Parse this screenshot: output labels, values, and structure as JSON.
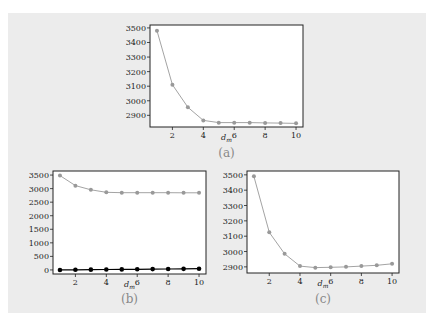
{
  "chart_data": [
    {
      "id": "a",
      "type": "line",
      "caption": "(a)",
      "xlabel": "d_m",
      "ylabel": "",
      "x": [
        1,
        2,
        3,
        4,
        5,
        6,
        7,
        8,
        9,
        10
      ],
      "xticks": [
        2,
        4,
        6,
        8,
        10
      ],
      "yticks": [
        2900,
        3000,
        3100,
        3200,
        3300,
        3400,
        3500
      ],
      "xlim": [
        0.55,
        10.45
      ],
      "ylim": [
        2820,
        3520
      ],
      "grid": false,
      "series": [
        {
          "name": "series-1",
          "color": "#999999",
          "marker": "circle",
          "values": [
            3480,
            3110,
            2955,
            2865,
            2850,
            2850,
            2850,
            2848,
            2847,
            2845
          ]
        }
      ],
      "box": {
        "left": 150,
        "top": 25,
        "right": 303,
        "bottom": 127
      },
      "xlabel_y": 140,
      "caption_y": 157
    },
    {
      "id": "b",
      "type": "line",
      "caption": "(b)",
      "xlabel": "d_m",
      "ylabel": "",
      "x": [
        1,
        2,
        3,
        4,
        5,
        6,
        7,
        8,
        9,
        10
      ],
      "xticks": [
        2,
        4,
        6,
        8,
        10
      ],
      "yticks": [
        0,
        500,
        1000,
        1500,
        2000,
        2500,
        3000,
        3500
      ],
      "xlim": [
        0.55,
        10.45
      ],
      "ylim": [
        -150,
        3650
      ],
      "grid": false,
      "series": [
        {
          "name": "series-1",
          "color": "#999999",
          "marker": "circle",
          "values": [
            3480,
            3110,
            2955,
            2865,
            2850,
            2850,
            2850,
            2848,
            2847,
            2845
          ]
        },
        {
          "name": "series-2",
          "color": "#000000",
          "marker": "circle",
          "values": [
            0,
            5,
            10,
            15,
            20,
            25,
            30,
            35,
            40,
            45
          ]
        }
      ],
      "box": {
        "left": 53,
        "top": 171,
        "right": 206,
        "bottom": 274
      },
      "xlabel_y": 287,
      "caption_y": 303
    },
    {
      "id": "c",
      "type": "line",
      "caption": "(c)",
      "xlabel": "d_m",
      "ylabel": "",
      "x": [
        1,
        2,
        3,
        4,
        5,
        6,
        7,
        8,
        9,
        10
      ],
      "xticks": [
        2,
        4,
        6,
        8,
        10
      ],
      "yticks": [
        2900,
        3000,
        3100,
        3200,
        3300,
        3400,
        3500
      ],
      "xlim": [
        0.55,
        10.45
      ],
      "ylim": [
        2860,
        3525
      ],
      "grid": false,
      "series": [
        {
          "name": "series-1",
          "color": "#999999",
          "marker": "circle",
          "values": [
            3490,
            3125,
            2985,
            2905,
            2895,
            2897,
            2900,
            2905,
            2910,
            2920
          ]
        }
      ],
      "box": {
        "left": 247,
        "top": 171,
        "right": 399,
        "bottom": 273
      },
      "xlabel_y": 286,
      "caption_y": 303
    }
  ]
}
